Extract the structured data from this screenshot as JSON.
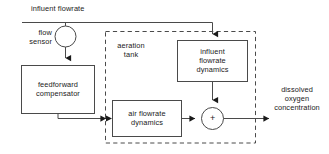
{
  "diagram": {
    "type": "block-diagram",
    "colors": {
      "line": "#4a4a4a",
      "text": "#1a1a1a",
      "background": "#ffffff"
    },
    "labels": {
      "influent_flowrate": "influent flowrate",
      "flow_sensor": "flow\nsensor",
      "feedforward_compensator": "feedforward\ncompensator",
      "aeration_tank": "aeration\ntank",
      "influent_flowrate_dynamics": "influent\nflowrate\ndynamics",
      "air_flowrate_dynamics": "air flowrate\ndynamics",
      "dissolved_oxygen_concentration": "dissolved\noxygen\nconcentration",
      "summing_junction_sign": "+"
    },
    "blocks": [
      {
        "name": "feedforward-compensator-block",
        "label": "feedforward\ncompensator",
        "shape": "rectangle"
      },
      {
        "name": "influent-flowrate-dynamics-block",
        "label": "influent\nflowrate\ndynamics",
        "shape": "rectangle"
      },
      {
        "name": "air-flowrate-dynamics-block",
        "label": "air flowrate\ndynamics",
        "shape": "rectangle"
      },
      {
        "name": "flow-sensor-block",
        "label": "flow\nsensor",
        "shape": "circle"
      },
      {
        "name": "summing-junction",
        "label": "+",
        "shape": "circle"
      },
      {
        "name": "aeration-tank-boundary",
        "label": "aeration\ntank",
        "shape": "dashed-rectangle"
      }
    ],
    "signals": [
      {
        "name": "influent-flowrate-signal",
        "label": "influent flowrate",
        "from": "input",
        "to": "flow-sensor-block"
      },
      {
        "name": "influent-flowrate-branch",
        "label": "",
        "from": "input",
        "to": "influent-flowrate-dynamics-block"
      },
      {
        "name": "sensor-to-compensator",
        "label": "",
        "from": "flow-sensor-block",
        "to": "feedforward-compensator-block"
      },
      {
        "name": "compensator-to-air-dynamics",
        "label": "",
        "from": "feedforward-compensator-block",
        "to": "air-flowrate-dynamics-block"
      },
      {
        "name": "air-dynamics-to-sum",
        "label": "",
        "from": "air-flowrate-dynamics-block",
        "to": "summing-junction"
      },
      {
        "name": "influent-dynamics-to-sum",
        "label": "",
        "from": "influent-flowrate-dynamics-block",
        "to": "summing-junction"
      },
      {
        "name": "sum-to-output",
        "label": "dissolved oxygen concentration",
        "from": "summing-junction",
        "to": "output"
      }
    ]
  }
}
